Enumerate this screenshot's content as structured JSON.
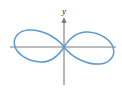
{
  "figure": {
    "title": "",
    "background_color": "#ffffff",
    "width": 122,
    "height": 92
  },
  "axes": {
    "x_axis": {
      "name": "x-axis",
      "label": "",
      "color": "#7a7a7a",
      "has_arrow": false,
      "pixel_start_x": 10,
      "pixel_end_x": 116,
      "pixel_y": 47
    },
    "y_axis": {
      "name": "y-axis",
      "label": "y",
      "color": "#7a7a7a",
      "has_arrow": true,
      "arrow_direction": "up",
      "pixel_x": 64,
      "pixel_top_y": 18,
      "pixel_bottom_y": 85
    }
  },
  "chart_data": {
    "type": "line",
    "title": "",
    "subtitle": "",
    "xlabel": "",
    "ylabel": "y",
    "curve_name": "lemniscate",
    "curve_color": "#5B9BD5",
    "curve_linewidth": 1.5,
    "grid": false,
    "legend": null,
    "legend_position": "none",
    "xlim": [
      -1.3,
      1.3
    ],
    "ylim": [
      -0.55,
      0.55
    ],
    "tick_labels_x": [],
    "tick_labels_y": [],
    "annotations": [
      {
        "text": "y",
        "kind": "axis-label",
        "x_pixel": 64,
        "y_pixel": 14
      }
    ],
    "equation": "(x^2 + y^2)^2 = a^2 (x^2 - y^2)",
    "parametric": {
      "x": "a*cos(t)/(1+sin(t)^2)",
      "y": "a*sin(t)*cos(t)/(1+sin(t)^2)",
      "t_range": [
        0,
        6.283185307179586
      ],
      "a": 1.0
    },
    "series": [
      {
        "name": "lemniscate",
        "color": "#5B9BD5",
        "x": [
          1.0,
          0.985,
          0.944,
          0.879,
          0.796,
          0.7,
          0.597,
          0.492,
          0.389,
          0.29,
          0.198,
          0.115,
          0.04,
          -0.04,
          -0.115,
          -0.198,
          -0.29,
          -0.389,
          -0.492,
          -0.597,
          -0.7,
          -0.796,
          -0.879,
          -0.944,
          -0.985,
          -1.0,
          -0.985,
          -0.944,
          -0.879,
          -0.796,
          -0.7,
          -0.597,
          -0.492,
          -0.389,
          -0.29,
          -0.198,
          -0.115,
          -0.04,
          0.04,
          0.115,
          0.198,
          0.29,
          0.389,
          0.492,
          0.597,
          0.7,
          0.796,
          0.879,
          0.944,
          0.985,
          1.0
        ],
        "y": [
          0.0,
          0.086,
          0.168,
          0.241,
          0.303,
          0.35,
          0.381,
          0.396,
          0.394,
          0.377,
          0.345,
          0.3,
          0.244,
          0.244,
          0.3,
          0.345,
          0.377,
          0.394,
          0.396,
          0.381,
          0.35,
          0.303,
          0.241,
          0.168,
          0.086,
          0.0,
          -0.086,
          -0.168,
          -0.241,
          -0.303,
          -0.35,
          -0.381,
          -0.396,
          -0.394,
          -0.377,
          -0.345,
          -0.3,
          -0.244,
          -0.244,
          -0.3,
          -0.345,
          -0.377,
          -0.394,
          -0.396,
          -0.381,
          -0.35,
          -0.303,
          -0.241,
          -0.168,
          -0.086,
          0.0
        ]
      }
    ],
    "lobes": [
      {
        "name": "left-lobe",
        "extent_x_pixel": [
          15,
          64
        ],
        "extent_y_pixel": [
          30,
          64
        ]
      },
      {
        "name": "right-lobe",
        "extent_x_pixel": [
          64,
          110
        ],
        "extent_y_pixel": [
          30,
          64
        ]
      }
    ]
  }
}
